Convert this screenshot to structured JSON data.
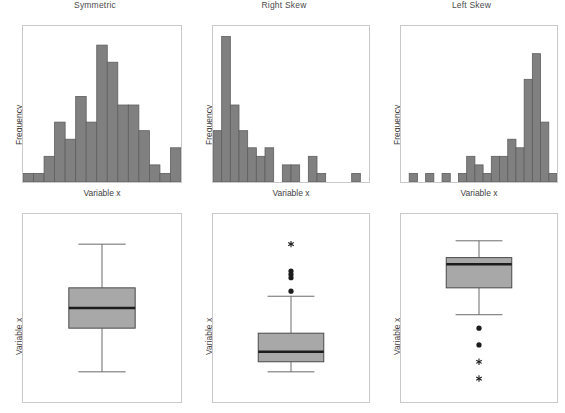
{
  "figure": {
    "width": 565,
    "height": 413,
    "background": "#ffffff",
    "bar_fill": "#808080",
    "bar_stroke": "#5e5e5e",
    "box_fill": "#a8a8a8",
    "box_stroke": "#4a4a4a",
    "median_color": "#1c1c1c",
    "frame_color": "#c9c9c9",
    "text_color": "#3f3f3f"
  },
  "columns": [
    {
      "title": "Symmetric"
    },
    {
      "title": "Right Skew"
    },
    {
      "title": "Left Skew"
    }
  ],
  "labels": {
    "x_axis": "Variable x",
    "y_axis_histogram": "Frequency",
    "y_axis_boxplot": "Variable x"
  },
  "chart_data": [
    {
      "type": "bar",
      "name": "symmetric-histogram",
      "title": "Symmetric",
      "xlabel": "Variable x",
      "ylabel": "Frequency",
      "grid": false,
      "legend": "none",
      "ylim": [
        0,
        18
      ],
      "categories": [
        "1",
        "2",
        "3",
        "4",
        "5",
        "6",
        "7",
        "8",
        "9",
        "10",
        "11",
        "12",
        "13",
        "14"
      ],
      "values": [
        1,
        1,
        3,
        7,
        5,
        10,
        7,
        16,
        14,
        9,
        9,
        6,
        2,
        1,
        4
      ]
    },
    {
      "type": "bar",
      "name": "right-skew-histogram",
      "title": "Right Skew",
      "xlabel": "Variable x",
      "ylabel": "Frequency",
      "grid": false,
      "legend": "none",
      "ylim": [
        0,
        18
      ],
      "categories": [
        "1",
        "2",
        "3",
        "4",
        "5",
        "6",
        "7",
        "8",
        "9",
        "10",
        "11",
        "12",
        "13",
        "14",
        "15",
        "16",
        "17",
        "18"
      ],
      "values": [
        6,
        17,
        9,
        6,
        4,
        3,
        4,
        0,
        2,
        2,
        0,
        3,
        1,
        0,
        0,
        0,
        1,
        0
      ]
    },
    {
      "type": "bar",
      "name": "left-skew-histogram",
      "title": "Left Skew",
      "xlabel": "Variable x",
      "ylabel": "Frequency",
      "grid": false,
      "legend": "none",
      "ylim": [
        0,
        18
      ],
      "categories": [
        "1",
        "2",
        "3",
        "4",
        "5",
        "6",
        "7",
        "8",
        "9",
        "10",
        "11",
        "12",
        "13",
        "14",
        "15",
        "16",
        "17",
        "18"
      ],
      "values": [
        0,
        1,
        0,
        1,
        0,
        1,
        0,
        1,
        3,
        2,
        1,
        3,
        3,
        5,
        4,
        12,
        15,
        7,
        1
      ]
    },
    {
      "type": "boxplot",
      "name": "symmetric-boxplot",
      "title": "Symmetric",
      "ylabel": "Variable x",
      "grid": false,
      "legend": "none",
      "ylim": [
        0,
        100
      ],
      "whisker_low": 12,
      "q1": 38,
      "median": 50,
      "q3": 62,
      "whisker_high": 88,
      "outlier_dots": [],
      "outlier_stars": []
    },
    {
      "type": "boxplot",
      "name": "right-skew-boxplot",
      "title": "Right Skew",
      "ylabel": "Variable x",
      "grid": false,
      "legend": "none",
      "ylim": [
        0,
        100
      ],
      "whisker_low": 12,
      "q1": 18,
      "median": 24,
      "q3": 35,
      "whisker_high": 57,
      "outlier_dots": [
        60,
        68,
        70,
        72
      ],
      "outlier_stars": [
        88
      ]
    },
    {
      "type": "boxplot",
      "name": "left-skew-boxplot",
      "title": "Left Skew",
      "ylabel": "Variable x",
      "grid": false,
      "legend": "none",
      "ylim": [
        0,
        100
      ],
      "whisker_low": 46,
      "q1": 62,
      "median": 76,
      "q3": 80,
      "whisker_high": 90,
      "outlier_dots": [
        38,
        28
      ],
      "outlier_stars": [
        18,
        8
      ]
    }
  ]
}
